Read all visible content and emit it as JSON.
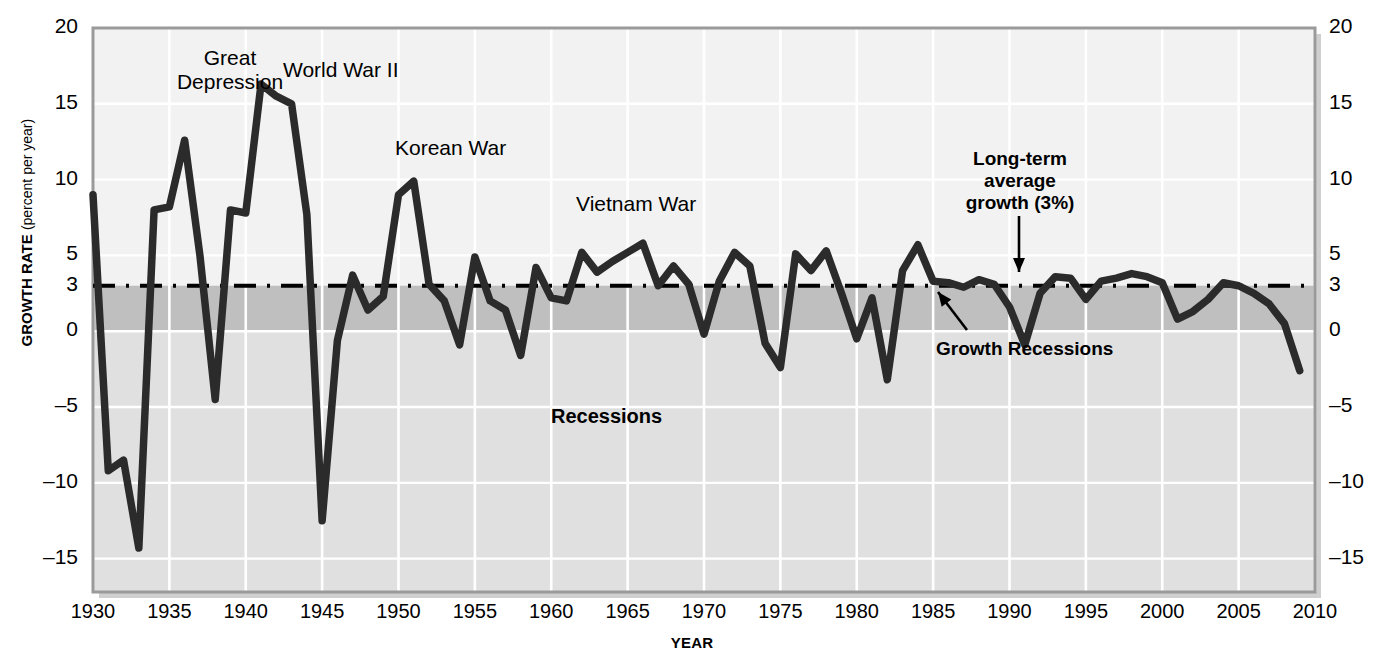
{
  "chart_data": {
    "type": "line",
    "title": "",
    "xlabel": "YEAR",
    "ylabel": "GROWTH RATE",
    "ylabel_sub": "(percent per year)",
    "xlim": [
      1930,
      2010
    ],
    "ylim": [
      -17.2,
      20
    ],
    "yticks": [
      20,
      15,
      10,
      5,
      3,
      0,
      -5,
      -10,
      -15
    ],
    "ytick_labels": [
      "20",
      "15",
      "10",
      "5",
      "3",
      "0",
      "–5",
      "–10",
      "–15"
    ],
    "xticks": [
      1930,
      1935,
      1940,
      1945,
      1950,
      1955,
      1960,
      1965,
      1970,
      1975,
      1980,
      1985,
      1990,
      1995,
      2000,
      2005,
      2010
    ],
    "xtick_labels": [
      "1930",
      "1935",
      "1940",
      "1945",
      "1950",
      "1955",
      "1960",
      "1965",
      "1970",
      "1975",
      "1980",
      "1985",
      "1990",
      "1995",
      "2000",
      "2005",
      "2010"
    ],
    "grid": true,
    "legend": "none",
    "reference_line": {
      "value": 3,
      "label": "Long-term average growth (3%)",
      "style": "dash-dot"
    },
    "bands": [
      {
        "name": "Growth Recessions",
        "from": 0,
        "to": 3,
        "color": "#bfbfbf"
      },
      {
        "name": "Recessions",
        "from": -17.2,
        "to": 0,
        "color": "#e0e0e0"
      }
    ],
    "series": [
      {
        "name": "Real GDP growth rate",
        "color": "#2b2b2b",
        "x": [
          1930,
          1931,
          1932,
          1933,
          1934,
          1935,
          1936,
          1937,
          1938,
          1939,
          1940,
          1941,
          1942,
          1943,
          1944,
          1945,
          1946,
          1947,
          1948,
          1949,
          1950,
          1951,
          1952,
          1953,
          1954,
          1955,
          1956,
          1957,
          1958,
          1959,
          1960,
          1961,
          1962,
          1963,
          1964,
          1965,
          1966,
          1967,
          1968,
          1969,
          1970,
          1971,
          1972,
          1973,
          1974,
          1975,
          1976,
          1977,
          1978,
          1979,
          1980,
          1981,
          1982,
          1983,
          1984,
          1985,
          1986,
          1987,
          1988,
          1989,
          1990,
          1991,
          1992,
          1993,
          1994,
          1995,
          1996,
          1997,
          1998,
          1999,
          2000,
          2001,
          2002,
          2003,
          2004,
          2005,
          2006,
          2007,
          2008,
          2009
        ],
        "y": [
          9.0,
          -9.2,
          -8.5,
          -14.3,
          8.0,
          8.2,
          12.6,
          5.0,
          -4.5,
          8.0,
          7.8,
          16.3,
          15.5,
          15.0,
          7.7,
          -12.5,
          -0.6,
          3.7,
          1.4,
          2.3,
          9.0,
          9.9,
          3.1,
          2.0,
          -0.9,
          4.9,
          2.0,
          1.4,
          -1.6,
          4.2,
          2.2,
          2.0,
          5.2,
          3.9,
          4.6,
          5.2,
          5.8,
          3.0,
          4.3,
          3.1,
          -0.2,
          3.3,
          5.2,
          4.3,
          -0.8,
          -2.4,
          5.1,
          4.0,
          5.3,
          2.5,
          -0.5,
          2.2,
          -3.2,
          4.0,
          5.7,
          3.3,
          3.2,
          2.9,
          3.4,
          3.1,
          1.6,
          -0.9,
          2.5,
          3.6,
          3.5,
          2.1,
          3.3,
          3.5,
          3.8,
          3.6,
          3.2,
          0.8,
          1.3,
          2.1,
          3.2,
          3.0,
          2.5,
          1.8,
          0.5,
          -2.6
        ]
      }
    ],
    "annotations": [
      {
        "id": "great-depression",
        "text": "Great\nDepression",
        "bold": false
      },
      {
        "id": "world-war-ii",
        "text": "World War II",
        "bold": false
      },
      {
        "id": "korean-war",
        "text": "Korean War",
        "bold": false
      },
      {
        "id": "vietnam-war",
        "text": "Vietnam War",
        "bold": false
      },
      {
        "id": "long-term-average",
        "text": "Long-term\naverage\ngrowth (3%)",
        "bold": true
      },
      {
        "id": "growth-recessions",
        "text": "Growth Recessions",
        "bold": true
      },
      {
        "id": "recessions",
        "text": "Recessions",
        "bold": true
      }
    ]
  },
  "labels": {
    "great_depression_l1": "Great",
    "great_depression_l2": "Depression",
    "world_war_ii": "World War II",
    "korean_war": "Korean War",
    "vietnam_war": "Vietnam War",
    "long_term_l1": "Long-term",
    "long_term_l2": "average",
    "long_term_l3": "growth (3%)",
    "growth_recessions": "Growth Recessions",
    "recessions": "Recessions",
    "y_axis_title": "GROWTH RATE",
    "y_axis_subtitle": "(percent per year)",
    "x_axis_title": "YEAR"
  },
  "colors": {
    "line": "#2b2b2b",
    "plot_bg": "#f2f2f2",
    "recession_band": "#e0e0e0",
    "growth_recession_band": "#bfbfbf",
    "grid": "#ffffff",
    "frame": "#9a9a9a",
    "text": "#000000"
  }
}
